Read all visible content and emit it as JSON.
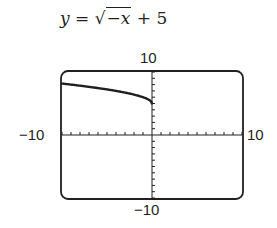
{
  "title": {
    "y": "y",
    "eq": "=",
    "radical": "√",
    "radicand": "−x",
    "tail": "+ 5"
  },
  "labels": {
    "ymax": "10",
    "ymin": "−10",
    "xmin": "−10",
    "xmax": "10"
  },
  "chart_data": {
    "type": "line",
    "xlabel": "",
    "ylabel": "",
    "xlim": [
      -10,
      10
    ],
    "ylim": [
      -10,
      10
    ],
    "xscl": 1,
    "yscl": 1,
    "grid": false,
    "series": [
      {
        "name": "y = √(−x) + 5",
        "x": [
          -10,
          -9,
          -8,
          -7,
          -6,
          -5,
          -4,
          -3,
          -2,
          -1,
          0
        ],
        "y": [
          8.16,
          8.0,
          7.83,
          7.65,
          7.45,
          7.24,
          7.0,
          6.73,
          6.41,
          6.0,
          5.0
        ]
      }
    ],
    "tick_labels": {
      "x": [
        "−10",
        "10"
      ],
      "y": [
        "−10",
        "10"
      ]
    }
  }
}
